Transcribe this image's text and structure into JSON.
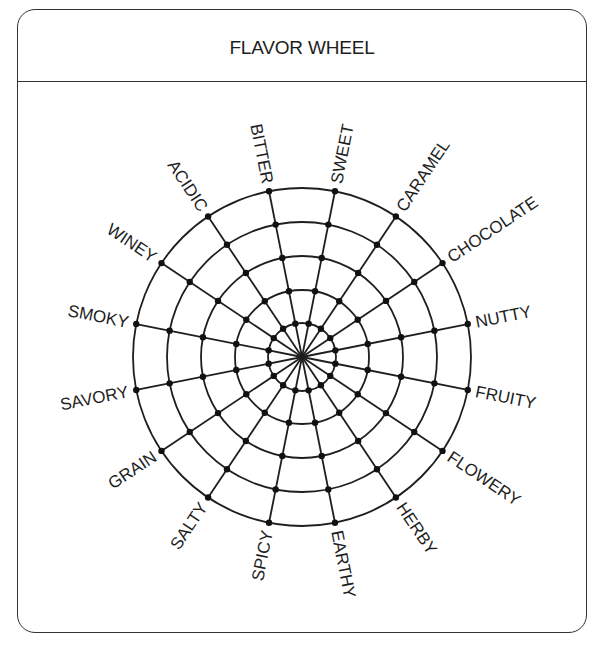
{
  "header": {
    "title": "FLAVOR WHEEL"
  },
  "wheel": {
    "center": [
      302,
      357
    ],
    "ring_radii": [
      34,
      67,
      101,
      135,
      169
    ],
    "label_offset": 8,
    "colors": {
      "line": "#1e1e1e",
      "node": "#111111",
      "text": "#1e1e1e"
    },
    "spokes": [
      {
        "label": "SWEET",
        "angle_deg": 11.25
      },
      {
        "label": "CARAMEL",
        "angle_deg": 33.75
      },
      {
        "label": "CHOCOLATE",
        "angle_deg": 56.25
      },
      {
        "label": "NUTTY",
        "angle_deg": 78.75
      },
      {
        "label": "FRUITY",
        "angle_deg": 101.25
      },
      {
        "label": "FLOWERY",
        "angle_deg": 123.75
      },
      {
        "label": "HERBY",
        "angle_deg": 146.25
      },
      {
        "label": "EARTHY",
        "angle_deg": 168.75
      },
      {
        "label": "SPICY",
        "angle_deg": 191.25
      },
      {
        "label": "SALTY",
        "angle_deg": 213.75
      },
      {
        "label": "GRAIN",
        "angle_deg": 236.25
      },
      {
        "label": "SAVORY",
        "angle_deg": 258.75
      },
      {
        "label": "SMOKY",
        "angle_deg": 281.25
      },
      {
        "label": "WINEY",
        "angle_deg": 303.75
      },
      {
        "label": "ACIDIC",
        "angle_deg": 326.25
      },
      {
        "label": "BITTER",
        "angle_deg": 348.75
      }
    ]
  }
}
